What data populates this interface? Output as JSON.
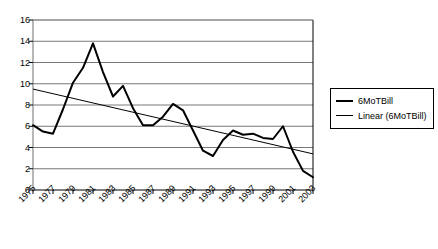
{
  "chart_data": {
    "type": "line",
    "title": "",
    "xlabel": "",
    "ylabel": "",
    "xlim": [
      1975,
      2003
    ],
    "ylim": [
      0,
      16
    ],
    "ytick_step": 2,
    "grid": true,
    "legend_position": "right",
    "x": [
      1975,
      1976,
      1977,
      1978,
      1979,
      1980,
      1981,
      1982,
      1983,
      1984,
      1985,
      1986,
      1987,
      1988,
      1989,
      1990,
      1991,
      1992,
      1993,
      1994,
      1995,
      1996,
      1997,
      1998,
      1999,
      2000,
      2001,
      2002,
      2003
    ],
    "xtick_labels": [
      "1975",
      "1977",
      "1979",
      "1981",
      "1983",
      "1985",
      "1987",
      "1989",
      "1991",
      "1993",
      "1995",
      "1997",
      "1999",
      "2001",
      "2003"
    ],
    "ytick_labels": [
      "0",
      "2",
      "4",
      "6",
      "8",
      "10",
      "12",
      "14",
      "16"
    ],
    "series": [
      {
        "name": "6MoTBill",
        "type": "line",
        "color": "#000000",
        "width": 2,
        "values": [
          6.1,
          5.5,
          5.3,
          7.6,
          10.1,
          11.5,
          13.8,
          11.1,
          8.8,
          9.8,
          7.7,
          6.1,
          6.1,
          6.9,
          8.1,
          7.5,
          5.6,
          3.7,
          3.2,
          4.7,
          5.6,
          5.2,
          5.3,
          4.9,
          4.8,
          6.0,
          3.6,
          1.8,
          1.2
        ]
      },
      {
        "name": "Linear (6MoTBill)",
        "type": "trendline",
        "color": "#000000",
        "width": 1,
        "endpoints": [
          9.5,
          3.4
        ]
      }
    ]
  },
  "legend": {
    "items": [
      {
        "label": "6MoTBill",
        "swatch": "series"
      },
      {
        "label": "Linear (6MoTBill)",
        "swatch": "trend"
      }
    ]
  }
}
